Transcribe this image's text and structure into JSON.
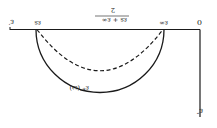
{
  "figure": {
    "orientation": "rotated 180 degrees",
    "type": "Cole-Cole plot",
    "labels": {
      "origin": "0",
      "x_axis": "ε′",
      "y_axis": "ε″",
      "eps_inf": "ε∞",
      "eps_s": "εs",
      "midpoint_num": "εs + ε∞",
      "midpoint_den": "2",
      "curve": "ε*″(ω)"
    },
    "curves": [
      {
        "name": "solid semicircle",
        "style": "solid"
      },
      {
        "name": "depressed arc",
        "style": "dashed"
      }
    ],
    "colors": {
      "ink": "#1a1a1a",
      "background": "#ffffff"
    }
  }
}
